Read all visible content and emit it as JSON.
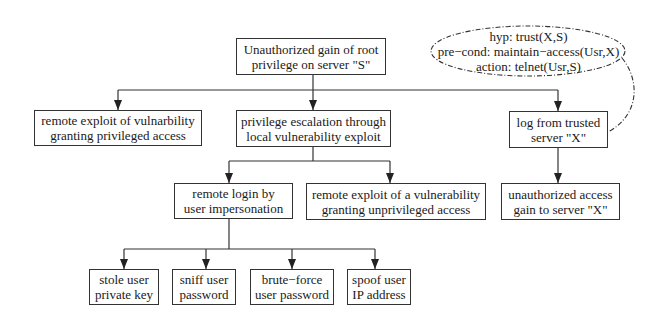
{
  "diagram": {
    "type": "attack-tree",
    "root": {
      "id": "root",
      "lines": [
        "Unauthorized gain of root",
        "privilege on server \"S\""
      ]
    },
    "level1": [
      {
        "id": "remote-exploit-privileged",
        "lines": [
          "remote exploit of vulnarbility",
          "granting privileged access"
        ]
      },
      {
        "id": "privilege-escalation",
        "lines": [
          "privilege escalation through",
          "local vulnerability exploit"
        ]
      },
      {
        "id": "log-from-trusted",
        "lines": [
          "log from trusted",
          "server \"X\""
        ]
      }
    ],
    "level2": [
      {
        "id": "remote-login",
        "parent": "privilege-escalation",
        "lines": [
          "remote login by",
          "user impersonation"
        ]
      },
      {
        "id": "remote-exploit-unprivileged",
        "parent": "privilege-escalation",
        "lines": [
          "remote exploit of a vulnerability",
          "granting unprivileged access"
        ]
      },
      {
        "id": "unauthorized-access-x",
        "parent": "log-from-trusted",
        "lines": [
          "unauthorized access",
          "gain to server \"X\""
        ]
      }
    ],
    "level3": [
      {
        "id": "stole-key",
        "parent": "remote-login",
        "lines": [
          "stole user",
          "private key"
        ]
      },
      {
        "id": "sniff-password",
        "parent": "remote-login",
        "lines": [
          "sniff user",
          "password"
        ]
      },
      {
        "id": "brute-force",
        "parent": "remote-login",
        "lines": [
          "brute−force",
          "user password"
        ]
      },
      {
        "id": "spoof-ip",
        "parent": "remote-login",
        "lines": [
          "spoof user",
          "IP address"
        ]
      }
    ],
    "annotation": {
      "attached_to": "log-from-trusted",
      "style": "dashed-ellipse",
      "lines": [
        "hyp: trust(X,S)",
        "pre−cond: maintain−access(Usr,X)",
        "action: telnet(Usr,S)"
      ]
    },
    "colors": {
      "stroke": "#333333",
      "text": "#1a1a1a",
      "background": "#ffffff"
    }
  }
}
